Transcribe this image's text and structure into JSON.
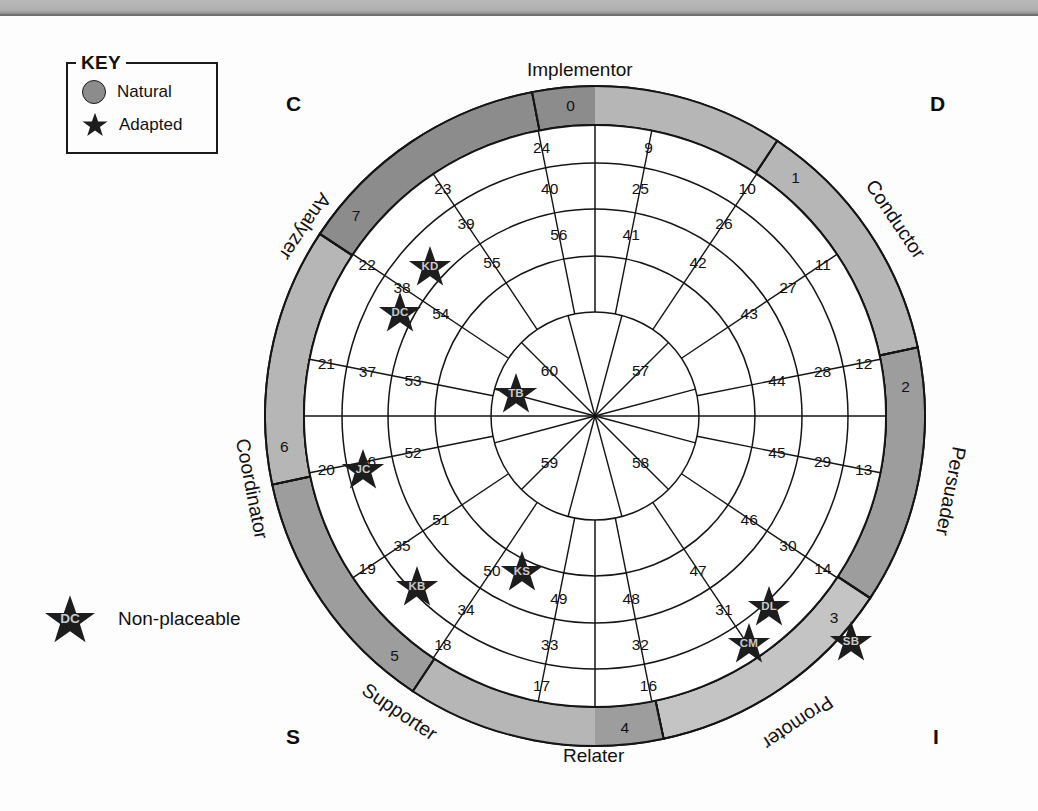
{
  "key": {
    "title": "KEY",
    "items": [
      {
        "marker": "circle",
        "label": "Natural"
      },
      {
        "marker": "star",
        "label": "Adapted"
      }
    ]
  },
  "non_placeable": {
    "marker_text": "DC",
    "label": "Non-placeable"
  },
  "corners": {
    "top_left": "C",
    "top_right": "D",
    "bottom_left": "S",
    "bottom_right": "I"
  },
  "colors": {
    "dark_gray": "#8c8c8c",
    "mid_gray": "#9d9d9d",
    "light_gray": "#b6b6b6",
    "pale_gray": "#c4c4c4",
    "outline": "#151515",
    "background": "#fdfdfd",
    "star_fill": "#1d1d1d",
    "star_text": "#c9c9c9"
  },
  "chart_data": {
    "type": "pie",
    "xlabel": "",
    "ylabel": "",
    "segment_labels": [
      {
        "name": "Implementor",
        "position": "top"
      },
      {
        "name": "Conductor",
        "position": "upper-right"
      },
      {
        "name": "Persuader",
        "position": "right"
      },
      {
        "name": "Promoter",
        "position": "lower-right"
      },
      {
        "name": "Relater",
        "position": "bottom"
      },
      {
        "name": "Supporter",
        "position": "lower-left"
      },
      {
        "name": "Coordinator",
        "position": "left"
      },
      {
        "name": "Analyzer",
        "position": "upper-left"
      }
    ],
    "rings": [
      {
        "ring": "outer",
        "count": 8,
        "numbers": [
          0,
          1,
          2,
          3,
          4,
          5,
          6,
          7
        ],
        "shades": [
          "dark_gray",
          "light_gray",
          "mid_gray",
          "pale_gray",
          "light_gray",
          "mid_gray",
          "light_gray",
          "dark_gray"
        ]
      },
      {
        "ring": "ring1",
        "count": 16,
        "numbers": [
          9,
          10,
          11,
          12,
          13,
          14,
          15,
          16,
          17,
          18,
          19,
          20,
          21,
          22,
          23,
          24
        ]
      },
      {
        "ring": "ring2",
        "count": 16,
        "numbers": [
          25,
          26,
          27,
          28,
          29,
          30,
          31,
          32,
          33,
          34,
          35,
          36,
          37,
          38,
          39,
          40
        ]
      },
      {
        "ring": "ring3",
        "count": 16,
        "numbers": [
          41,
          42,
          43,
          44,
          45,
          46,
          47,
          48,
          49,
          50,
          51,
          52,
          53,
          54,
          55,
          56
        ]
      },
      {
        "ring": "inner",
        "count": 4,
        "numbers": [
          57,
          58,
          59,
          60
        ]
      }
    ],
    "markers": [
      {
        "label": "KD",
        "type": "star",
        "cell": 23
      },
      {
        "label": "DC",
        "type": "star",
        "cell": 22
      },
      {
        "label": "TB",
        "type": "star",
        "cell": 54
      },
      {
        "label": "JC",
        "type": "star",
        "cell": 21
      },
      {
        "label": "KB",
        "type": "star",
        "cell": 19
      },
      {
        "label": "KS",
        "type": "star",
        "cell": 50
      },
      {
        "label": "DL",
        "type": "star",
        "cell": 31
      },
      {
        "label": "CM",
        "type": "star",
        "cell": 16
      },
      {
        "label": "SB",
        "type": "star",
        "cell": 3
      }
    ]
  }
}
